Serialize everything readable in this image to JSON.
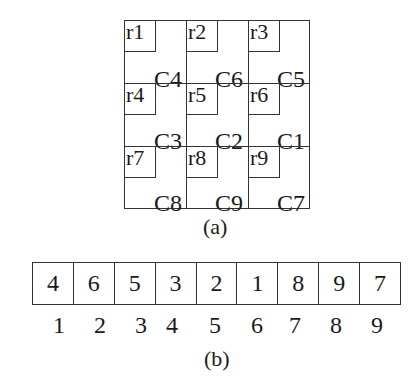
{
  "figure_a": {
    "caption": "(a)",
    "cells": [
      {
        "r": "r1",
        "c": "C4"
      },
      {
        "r": "r2",
        "c": "C6"
      },
      {
        "r": "r3",
        "c": "C5"
      },
      {
        "r": "r4",
        "c": "C3"
      },
      {
        "r": "r5",
        "c": "C2"
      },
      {
        "r": "r6",
        "c": "C1"
      },
      {
        "r": "r7",
        "c": "C8"
      },
      {
        "r": "r8",
        "c": "C9"
      },
      {
        "r": "r9",
        "c": "C7"
      }
    ]
  },
  "figure_b": {
    "caption": "(b)",
    "values": [
      "4",
      "6",
      "5",
      "3",
      "2",
      "1",
      "8",
      "9",
      "7"
    ],
    "indices": [
      "1",
      "2",
      "3",
      "4",
      "5",
      "6",
      "7",
      "8",
      "9"
    ]
  }
}
